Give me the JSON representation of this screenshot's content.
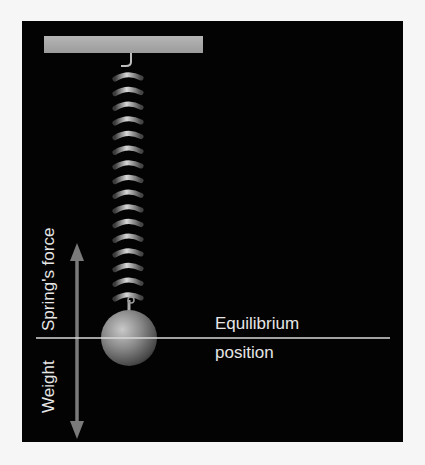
{
  "diagram": {
    "labels": {
      "spring_force": "Spring's force",
      "weight": "Weight",
      "equilibrium_line1": "Equilibrium",
      "equilibrium_line2": "position"
    },
    "colors": {
      "background": "#030303",
      "page": "#f6f6f6",
      "bar": "#a9a9a9",
      "arrow": "#7a7a7a",
      "line": "#d9d9d9",
      "text": "#e6e6e6"
    },
    "spring": {
      "coils": 16
    }
  }
}
